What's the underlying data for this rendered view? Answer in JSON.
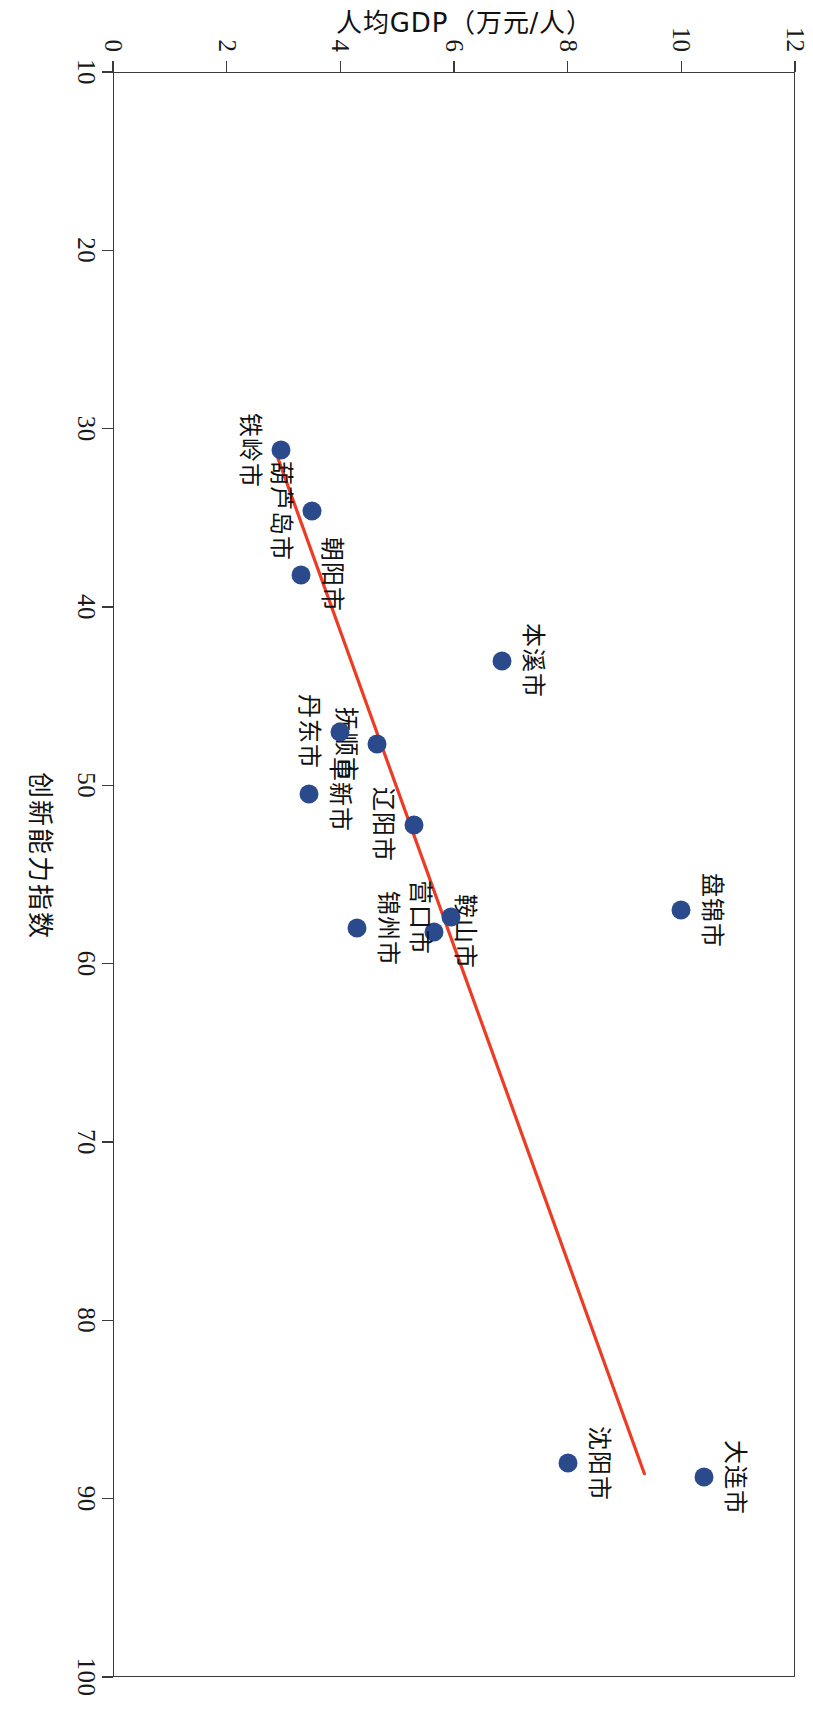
{
  "chart_data": {
    "type": "scatter",
    "title": "",
    "xlabel": "创新能力指数",
    "ylabel": "人均GDP（万元/人）",
    "xlim": [
      10,
      100
    ],
    "ylim": [
      0,
      12
    ],
    "xticks": [
      10,
      20,
      30,
      40,
      50,
      60,
      70,
      80,
      90,
      100
    ],
    "yticks": [
      0,
      2,
      4,
      6,
      8,
      10,
      12
    ],
    "grid": false,
    "legend": null,
    "marker_color": "#2b4a8b",
    "trendline_color": "#ee3b24",
    "frame_color": "#3a3a3a",
    "points": [
      {
        "label": "大连市",
        "x": 88.8,
        "y": 10.4,
        "label_pos": "above"
      },
      {
        "label": "沈阳市",
        "x": 88.0,
        "y": 8.0,
        "label_pos": "above"
      },
      {
        "label": "盘锦市",
        "x": 57.0,
        "y": 10.0,
        "label_pos": "above"
      },
      {
        "label": "鞍山市",
        "x": 58.2,
        "y": 5.65,
        "label_pos": "above"
      },
      {
        "label": "营口市",
        "x": 57.4,
        "y": 5.95,
        "label_pos": "below"
      },
      {
        "label": "锦州市",
        "x": 58.0,
        "y": 4.3,
        "label_pos": "above"
      },
      {
        "label": "辽阳市",
        "x": 52.2,
        "y": 5.3,
        "label_pos": "below"
      },
      {
        "label": "抚顺市",
        "x": 47.7,
        "y": 4.65,
        "label_pos": "below"
      },
      {
        "label": "丹东市",
        "x": 47.0,
        "y": 4.0,
        "label_pos": "below"
      },
      {
        "label": "阜新市",
        "x": 50.5,
        "y": 3.45,
        "label_pos": "above"
      },
      {
        "label": "本溪市",
        "x": 43.0,
        "y": 6.85,
        "label_pos": "above"
      },
      {
        "label": "朝阳市",
        "x": 38.2,
        "y": 3.3,
        "label_pos": "above"
      },
      {
        "label": "葫芦岛市",
        "x": 34.6,
        "y": 3.5,
        "label_pos": "below"
      },
      {
        "label": "铁岭市",
        "x": 31.2,
        "y": 2.95,
        "label_pos": "below"
      }
    ],
    "trendline": {
      "x0": 31.2,
      "y0": 2.85,
      "x1": 88.6,
      "y1": 9.35
    }
  }
}
